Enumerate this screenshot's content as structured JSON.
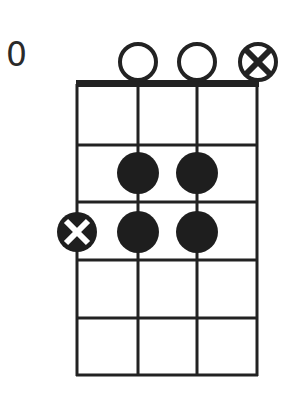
{
  "diagram": {
    "type": "chord-diagram",
    "instrument_strings": 4,
    "fret_label": "0",
    "colors": {
      "ink": "#222222",
      "background": "#ffffff"
    },
    "string_markers_top": [
      {
        "string": 1,
        "marker": "none"
      },
      {
        "string": 2,
        "marker": "open"
      },
      {
        "string": 3,
        "marker": "open"
      },
      {
        "string": 4,
        "marker": "muted-circle-x"
      }
    ],
    "fingered_dots": [
      {
        "string": 2,
        "fret": 2
      },
      {
        "string": 3,
        "fret": 2
      },
      {
        "string": 2,
        "fret": 3
      },
      {
        "string": 3,
        "fret": 3
      }
    ],
    "muted_dots": [
      {
        "string": 1,
        "fret": 3,
        "marker": "filled-circle-white-x"
      }
    ],
    "frets_shown": 5
  }
}
